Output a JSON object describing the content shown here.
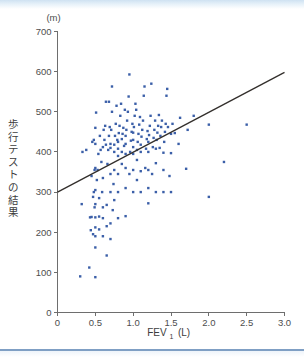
{
  "figure": {
    "unit_label": "(m)",
    "y_axis_title": "歩行テストの結果",
    "x_axis_title": "FEV",
    "x_axis_subscript": "1",
    "x_axis_unit": "(L)",
    "point_color": "#3b5fa8",
    "line_color": "#332f2c"
  },
  "chart_data": {
    "type": "scatter",
    "title": "",
    "xlabel": "FEV1 (L)",
    "ylabel": "歩行テストの結果 (m)",
    "xlim": [
      0,
      3.0
    ],
    "ylim": [
      0,
      700
    ],
    "xticks": [
      "0",
      "0.5",
      "1.0",
      "1.5",
      "2.0",
      "2.5",
      "3.0"
    ],
    "xtick_values": [
      0,
      0.5,
      1.0,
      1.5,
      2.0,
      2.5,
      3.0
    ],
    "yticks": [
      "0",
      "100",
      "200",
      "300",
      "400",
      "500",
      "600",
      "700"
    ],
    "ytick_values": [
      0,
      100,
      200,
      300,
      400,
      500,
      600,
      700
    ],
    "grid": false,
    "legend": null,
    "trendline": {
      "type": "linear",
      "x_start": 0.0,
      "y_start": 300,
      "x_end": 3.0,
      "y_end": 598
    },
    "points": [
      [
        0.3,
        90
      ],
      [
        0.32,
        270
      ],
      [
        0.33,
        400
      ],
      [
        0.38,
        405
      ],
      [
        0.42,
        112
      ],
      [
        0.43,
        237
      ],
      [
        0.44,
        205
      ],
      [
        0.45,
        238
      ],
      [
        0.45,
        340
      ],
      [
        0.46,
        425
      ],
      [
        0.47,
        288
      ],
      [
        0.47,
        195
      ],
      [
        0.48,
        300
      ],
      [
        0.48,
        430
      ],
      [
        0.49,
        262
      ],
      [
        0.49,
        355
      ],
      [
        0.5,
        88
      ],
      [
        0.5,
        162
      ],
      [
        0.5,
        190
      ],
      [
        0.5,
        212
      ],
      [
        0.5,
        237
      ],
      [
        0.5,
        270
      ],
      [
        0.5,
        305
      ],
      [
        0.5,
        360
      ],
      [
        0.5,
        420
      ],
      [
        0.5,
        460
      ],
      [
        0.51,
        498
      ],
      [
        0.52,
        330
      ],
      [
        0.53,
        355
      ],
      [
        0.54,
        395
      ],
      [
        0.55,
        207
      ],
      [
        0.55,
        239
      ],
      [
        0.55,
        285
      ],
      [
        0.56,
        440
      ],
      [
        0.57,
        405
      ],
      [
        0.58,
        375
      ],
      [
        0.59,
        300
      ],
      [
        0.6,
        190
      ],
      [
        0.6,
        235
      ],
      [
        0.6,
        262
      ],
      [
        0.6,
        335
      ],
      [
        0.6,
        412
      ],
      [
        0.61,
        455
      ],
      [
        0.62,
        430
      ],
      [
        0.63,
        465
      ],
      [
        0.64,
        418
      ],
      [
        0.64,
        525
      ],
      [
        0.65,
        142
      ],
      [
        0.65,
        215
      ],
      [
        0.65,
        268
      ],
      [
        0.66,
        370
      ],
      [
        0.67,
        405
      ],
      [
        0.68,
        440
      ],
      [
        0.68,
        525
      ],
      [
        0.69,
        462
      ],
      [
        0.7,
        183
      ],
      [
        0.7,
        222
      ],
      [
        0.7,
        300
      ],
      [
        0.7,
        345
      ],
      [
        0.7,
        410
      ],
      [
        0.7,
        420
      ],
      [
        0.71,
        455
      ],
      [
        0.72,
        500
      ],
      [
        0.72,
        563
      ],
      [
        0.73,
        255
      ],
      [
        0.74,
        320
      ],
      [
        0.75,
        280
      ],
      [
        0.75,
        355
      ],
      [
        0.75,
        400
      ],
      [
        0.75,
        418
      ],
      [
        0.76,
        440
      ],
      [
        0.77,
        470
      ],
      [
        0.78,
        515
      ],
      [
        0.79,
        430
      ],
      [
        0.8,
        235
      ],
      [
        0.8,
        300
      ],
      [
        0.8,
        345
      ],
      [
        0.8,
        390
      ],
      [
        0.8,
        408
      ],
      [
        0.8,
        425
      ],
      [
        0.81,
        447
      ],
      [
        0.82,
        465
      ],
      [
        0.83,
        490
      ],
      [
        0.84,
        520
      ],
      [
        0.85,
        370
      ],
      [
        0.85,
        400
      ],
      [
        0.85,
        432
      ],
      [
        0.86,
        445
      ],
      [
        0.87,
        460
      ],
      [
        0.88,
        415
      ],
      [
        0.89,
        505
      ],
      [
        0.9,
        240
      ],
      [
        0.9,
        310
      ],
      [
        0.9,
        360
      ],
      [
        0.9,
        395
      ],
      [
        0.9,
        420
      ],
      [
        0.9,
        440
      ],
      [
        0.91,
        455
      ],
      [
        0.92,
        478
      ],
      [
        0.93,
        500
      ],
      [
        0.94,
        538
      ],
      [
        0.95,
        593
      ],
      [
        0.95,
        345
      ],
      [
        0.96,
        400
      ],
      [
        0.97,
        428
      ],
      [
        0.98,
        450
      ],
      [
        0.99,
        470
      ],
      [
        1.0,
        300
      ],
      [
        1.0,
        355
      ],
      [
        1.0,
        395
      ],
      [
        1.0,
        412
      ],
      [
        1.0,
        430
      ],
      [
        1.0,
        448
      ],
      [
        1.01,
        462
      ],
      [
        1.02,
        490
      ],
      [
        1.03,
        520
      ],
      [
        1.04,
        505
      ],
      [
        1.05,
        330
      ],
      [
        1.05,
        380
      ],
      [
        1.05,
        405
      ],
      [
        1.06,
        425
      ],
      [
        1.07,
        445
      ],
      [
        1.08,
        468
      ],
      [
        1.09,
        487
      ],
      [
        1.1,
        300
      ],
      [
        1.1,
        352
      ],
      [
        1.1,
        400
      ],
      [
        1.1,
        418
      ],
      [
        1.11,
        438
      ],
      [
        1.12,
        455
      ],
      [
        1.13,
        478
      ],
      [
        1.14,
        540
      ],
      [
        1.15,
        563
      ],
      [
        1.16,
        360
      ],
      [
        1.17,
        408
      ],
      [
        1.18,
        432
      ],
      [
        1.19,
        452
      ],
      [
        1.2,
        272
      ],
      [
        1.2,
        310
      ],
      [
        1.2,
        355
      ],
      [
        1.2,
        400
      ],
      [
        1.2,
        425
      ],
      [
        1.21,
        442
      ],
      [
        1.22,
        465
      ],
      [
        1.23,
        490
      ],
      [
        1.24,
        570
      ],
      [
        1.25,
        345
      ],
      [
        1.26,
        412
      ],
      [
        1.27,
        435
      ],
      [
        1.28,
        455
      ],
      [
        1.29,
        478
      ],
      [
        1.3,
        300
      ],
      [
        1.3,
        372
      ],
      [
        1.3,
        408
      ],
      [
        1.31,
        430
      ],
      [
        1.32,
        448
      ],
      [
        1.33,
        465
      ],
      [
        1.34,
        492
      ],
      [
        1.35,
        410
      ],
      [
        1.36,
        440
      ],
      [
        1.37,
        462
      ],
      [
        1.38,
        478
      ],
      [
        1.4,
        300
      ],
      [
        1.4,
        355
      ],
      [
        1.4,
        398
      ],
      [
        1.41,
        425
      ],
      [
        1.42,
        450
      ],
      [
        1.43,
        470
      ],
      [
        1.44,
        540
      ],
      [
        1.45,
        557
      ],
      [
        1.46,
        462
      ],
      [
        1.48,
        340
      ],
      [
        1.5,
        300
      ],
      [
        1.5,
        397
      ],
      [
        1.5,
        445
      ],
      [
        1.52,
        470
      ],
      [
        1.55,
        447
      ],
      [
        1.6,
        420
      ],
      [
        1.62,
        485
      ],
      [
        1.7,
        358
      ],
      [
        1.72,
        455
      ],
      [
        1.8,
        490
      ],
      [
        2.0,
        288
      ],
      [
        2.0,
        468
      ],
      [
        2.2,
        375
      ],
      [
        2.5,
        468
      ]
    ]
  }
}
